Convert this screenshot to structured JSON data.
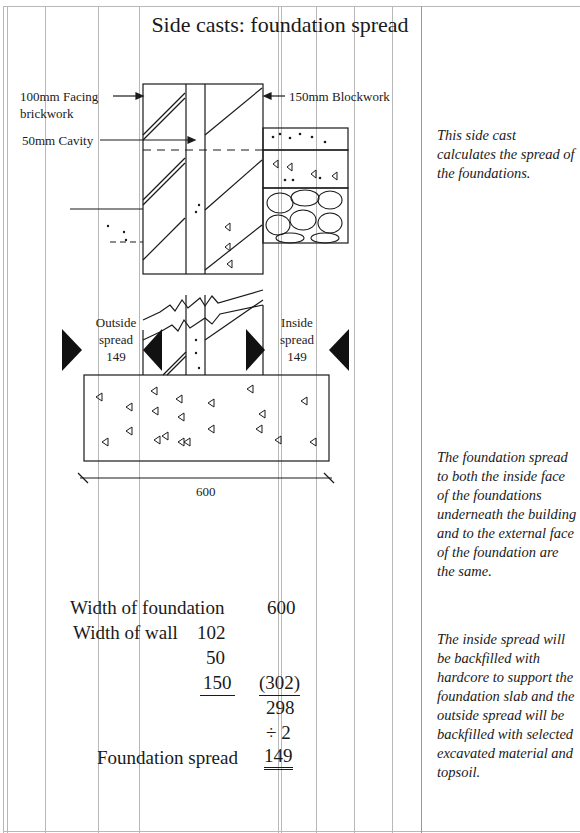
{
  "page": {
    "title": "Side casts: foundation spread"
  },
  "drawing": {
    "labels": {
      "facing_brickwork_line1": "100mm Facing",
      "facing_brickwork_line2": "brickwork",
      "blockwork": "150mm Blockwork",
      "cavity": "50mm Cavity",
      "outside_spread_line1": "Outside",
      "outside_spread_line2": "spread",
      "outside_spread_value": "149",
      "inside_spread_line1": "Inside",
      "inside_spread_line2": "spread",
      "inside_spread_value": "149",
      "foundation_width": "600"
    }
  },
  "calculation": {
    "rows": [
      {
        "label": "Width of foundation",
        "col1": "",
        "col2": "600"
      },
      {
        "label": "Width of wall",
        "col1": "102",
        "col2": ""
      },
      {
        "label": "",
        "col1": "50",
        "col2": ""
      },
      {
        "label": "",
        "col1": "150",
        "col2": "(302)"
      },
      {
        "label": "",
        "col1": "",
        "col2": "298"
      },
      {
        "label": "",
        "col1": "",
        "col2": "÷ 2"
      },
      {
        "label": "Foundation spread",
        "col1": "",
        "col2": "149"
      }
    ]
  },
  "notes": {
    "note1": "This side cast calculates the spread of the foundations.",
    "note2": "The foundation spread to both the inside face of the foundations underneath the building and to the external face of the foundation are the same.",
    "note3": "The inside spread will be backfilled with hardcore to support the foundation slab and the outside spread will be backfilled with selected excavated material and topsoil."
  }
}
